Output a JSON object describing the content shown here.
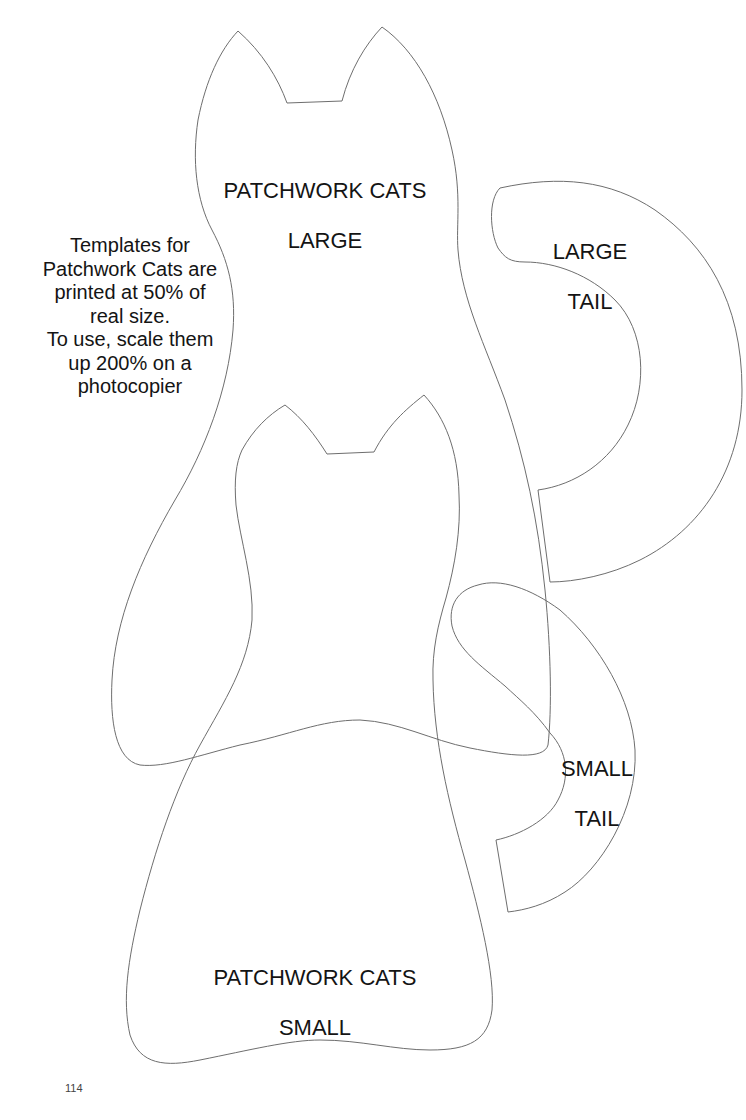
{
  "page": {
    "number": "114",
    "background": "#ffffff",
    "outline_color": "#6e6e6e",
    "text_color": "#141414"
  },
  "templates": {
    "large_cat": {
      "label_lines": [
        "PATCHWORK CATS",
        "LARGE"
      ]
    },
    "large_tail": {
      "label_lines": [
        "LARGE",
        "TAIL"
      ]
    },
    "small_cat": {
      "label_lines": [
        "PATCHWORK CATS",
        "SMALL"
      ]
    },
    "small_tail": {
      "label_lines": [
        "SMALL",
        "TAIL"
      ]
    }
  },
  "instructions": {
    "lines": [
      "Templates for",
      "Patchwork Cats are",
      "printed at 50% of",
      "real size.",
      "To use, scale them",
      "up 200% on a",
      "photocopier"
    ],
    "print_scale_percent": 50,
    "enlarge_percent": 200
  }
}
